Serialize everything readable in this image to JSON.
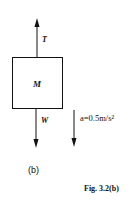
{
  "diagram": {
    "block": {
      "label": "M"
    },
    "forces": [
      {
        "name": "tension",
        "label": "T",
        "direction": "up"
      },
      {
        "name": "weight",
        "label": "W",
        "direction": "down"
      }
    ],
    "acceleration": {
      "label": "a=0.5m/s²",
      "direction": "down"
    },
    "sublabel": "(b)",
    "caption": "Fig. 3.2(b)"
  }
}
